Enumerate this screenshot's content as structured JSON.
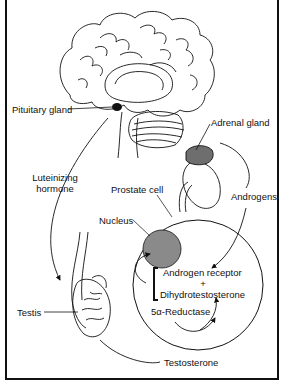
{
  "diagram": {
    "type": "biological pathway illustration",
    "labels": {
      "pituitary_gland": "Pituitary gland",
      "adrenal_gland": "Adrenal gland",
      "luteinizing_hormone_line1": "Luteinizing",
      "luteinizing_hormone_line2": "hormone",
      "prostate_cell": "Prostate cell",
      "androgens": "Androgens",
      "nucleus": "Nucleus",
      "androgen_receptor": "Androgen receptor",
      "plus": "+",
      "dihydrotestosterone": "Dihydrotestosterone",
      "reductase": "5α-Reductase",
      "testis": "Testis",
      "testosterone": "Testosterone"
    },
    "nodes": [
      "Brain / Pituitary gland",
      "Adrenal gland / Kidney",
      "Testis",
      "Prostate cell",
      "Nucleus"
    ],
    "edges": [
      {
        "from": "Pituitary gland",
        "to": "Testis",
        "label": "Luteinizing hormone"
      },
      {
        "from": "Adrenal gland",
        "to": "Prostate cell",
        "label": "Androgens"
      },
      {
        "from": "Testis",
        "to": "Prostate cell",
        "label": "Testosterone"
      },
      {
        "from": "Testosterone",
        "to": "Dihydrotestosterone",
        "label": "5α-Reductase"
      },
      {
        "from": "Androgen receptor + Dihydrotestosterone",
        "to": "Nucleus",
        "label": ""
      }
    ],
    "colors": {
      "line": "#111111",
      "nucleus_fill": "#8a8a8a",
      "pituitary_fill": "#111111",
      "adrenal_fill": "#6e6e6e",
      "background": "#ffffff"
    }
  }
}
